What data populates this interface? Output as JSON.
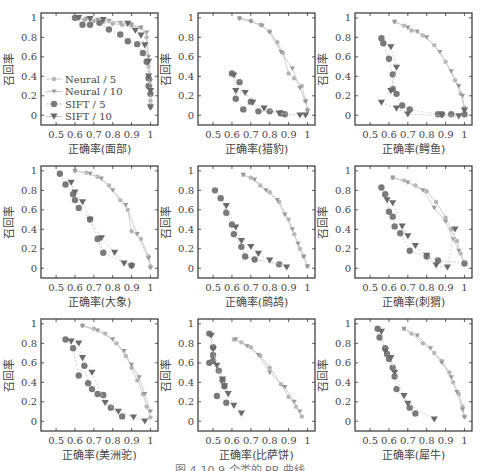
{
  "figure": {
    "caption": "图 4-10 9 个类的 PR 曲线",
    "ylabel": "召回率",
    "xticks": [
      "0.5",
      "0.6",
      "0.7",
      "0.8",
      "0.9",
      "1"
    ],
    "yticks": [
      "0",
      "0.2",
      "0.4",
      "0.6",
      "0.8",
      "1"
    ],
    "legend": [
      "Neural / 5",
      "Neural / 10",
      "SIFT / 5",
      "SIFT / 10"
    ],
    "colors": {
      "neural5": "#b4b4b4",
      "neural10": "#9a9a9a",
      "sift5": "#7a7a7a",
      "sift10": "#6a6a6a",
      "line": "#c8c8c8",
      "axis": "#333333"
    }
  },
  "chart_data": [
    {
      "type": "scatter",
      "title": "面部",
      "xlabel": "正确率(面部)",
      "ylabel": "召回率",
      "xlim": [
        0.42,
        1.04
      ],
      "ylim": [
        -0.1,
        1.05
      ],
      "legend_position": "lower left",
      "series": [
        {
          "name": "Neural/5",
          "x": [
            0.6,
            0.65,
            0.7,
            0.75,
            0.8,
            0.85,
            0.9,
            0.95,
            0.98,
            0.99,
            1.0,
            1.0,
            1.0
          ],
          "y": [
            1,
            0.98,
            0.97,
            0.96,
            0.94,
            0.93,
            0.92,
            0.9,
            0.8,
            0.5,
            0.3,
            0.15,
            0.08
          ]
        },
        {
          "name": "Neural/10",
          "x": [
            0.6,
            0.66,
            0.72,
            0.78,
            0.84,
            0.9,
            0.95,
            0.98,
            0.99,
            1.0,
            1.0
          ],
          "y": [
            1,
            0.99,
            0.98,
            0.97,
            0.95,
            0.93,
            0.9,
            0.85,
            0.6,
            0.35,
            0.1
          ]
        },
        {
          "name": "SIFT/5",
          "x": [
            0.6,
            0.64,
            0.68,
            0.73,
            0.78,
            0.84,
            0.88,
            0.93,
            0.96,
            0.98,
            0.99,
            0.99,
            1.0
          ],
          "y": [
            1,
            0.93,
            0.93,
            0.95,
            0.88,
            0.83,
            0.76,
            0.73,
            0.64,
            0.55,
            0.38,
            0.3,
            0.22
          ]
        },
        {
          "name": "SIFT/10",
          "x": [
            0.62,
            0.68,
            0.75,
            0.88,
            0.92,
            0.95,
            0.97,
            0.99,
            0.99,
            1.0,
            1.0
          ],
          "y": [
            1,
            0.99,
            0.98,
            0.94,
            0.87,
            0.82,
            0.72,
            0.55,
            0.4,
            0.25,
            0.08
          ]
        }
      ]
    },
    {
      "type": "scatter",
      "title": "猎豹",
      "xlabel": "正确率(猎豹)",
      "ylabel": "召回率",
      "xlim": [
        0.42,
        1.04
      ],
      "ylim": [
        -0.1,
        1.05
      ],
      "series": [
        {
          "name": "Neural/5",
          "x": [
            0.64,
            0.7,
            0.75,
            0.8,
            0.84,
            0.87,
            0.9,
            0.93,
            0.97,
            0.99,
            1.0
          ],
          "y": [
            1,
            0.97,
            0.93,
            0.86,
            0.75,
            0.64,
            0.43,
            0.38,
            0.3,
            0.15,
            0.06
          ]
        },
        {
          "name": "Neural/10",
          "x": [
            0.64,
            0.7,
            0.76,
            0.8,
            0.86,
            0.92,
            0.96,
            0.99,
            1.0
          ],
          "y": [
            0.99,
            0.96,
            0.92,
            0.85,
            0.65,
            0.48,
            0.28,
            0.14,
            0.04
          ]
        },
        {
          "name": "SIFT/5",
          "x": [
            0.6,
            0.64,
            0.62,
            0.66,
            0.7,
            0.74,
            0.8,
            0.86,
            0.88
          ],
          "y": [
            0.43,
            0.34,
            0.17,
            0.06,
            0.14,
            0.04,
            0.04,
            0.02,
            0.01
          ]
        },
        {
          "name": "SIFT/10",
          "x": [
            0.61,
            0.62,
            0.67,
            0.71,
            0.77,
            0.85,
            0.96,
            0.99
          ],
          "y": [
            0.41,
            0.25,
            0.23,
            0.13,
            0.07,
            0.02,
            0.0,
            0.0
          ]
        }
      ]
    },
    {
      "type": "scatter",
      "title": "鳄鱼",
      "xlabel": "正确率(鳄鱼)",
      "ylabel": "召回率",
      "xlim": [
        0.42,
        1.04
      ],
      "ylim": [
        -0.1,
        1.05
      ],
      "series": [
        {
          "name": "Neural/5",
          "x": [
            0.63,
            0.68,
            0.72,
            0.78,
            0.84,
            0.9,
            0.95,
            0.98,
            1.0,
            1.0
          ],
          "y": [
            0.96,
            0.92,
            0.87,
            0.82,
            0.72,
            0.55,
            0.36,
            0.22,
            0.08,
            0.01
          ]
        },
        {
          "name": "Neural/10",
          "x": [
            0.63,
            0.7,
            0.75,
            0.8,
            0.87,
            0.93,
            0.97,
            0.99,
            1.0
          ],
          "y": [
            0.96,
            0.9,
            0.86,
            0.8,
            0.65,
            0.45,
            0.3,
            0.2,
            0.05
          ]
        },
        {
          "name": "SIFT/5",
          "x": [
            0.56,
            0.57,
            0.6,
            0.62,
            0.62,
            0.64,
            0.67,
            0.71,
            0.86,
            0.88,
            0.93,
            1.0
          ],
          "y": [
            0.79,
            0.74,
            0.58,
            0.42,
            0.27,
            0.22,
            0.1,
            0.06,
            0.01,
            0.01,
            0.01,
            0.01
          ]
        },
        {
          "name": "SIFT/10",
          "x": [
            0.61,
            0.64,
            0.61,
            0.56,
            0.64,
            0.7,
            0.88,
            0.97,
            1.0
          ],
          "y": [
            0.7,
            0.49,
            0.25,
            0.13,
            0.07,
            0.01,
            0.0,
            -0.01,
            0.05
          ]
        }
      ]
    },
    {
      "type": "scatter",
      "title": "大象",
      "xlabel": "正确率(大象)",
      "ylabel": "召回率",
      "xlim": [
        0.42,
        1.04
      ],
      "ylim": [
        -0.1,
        1.05
      ],
      "series": [
        {
          "name": "Neural/5",
          "x": [
            0.6,
            0.66,
            0.72,
            0.78,
            0.84,
            0.88,
            0.9,
            0.95,
            0.99,
            1.0
          ],
          "y": [
            1,
            0.98,
            0.94,
            0.85,
            0.7,
            0.6,
            0.38,
            0.3,
            0.12,
            0.02
          ]
        },
        {
          "name": "Neural/10",
          "x": [
            0.6,
            0.68,
            0.74,
            0.8,
            0.87,
            0.93,
            0.99,
            1.0
          ],
          "y": [
            1,
            0.97,
            0.92,
            0.8,
            0.65,
            0.35,
            0.1,
            0.0
          ]
        },
        {
          "name": "SIFT/5",
          "x": [
            0.52,
            0.55,
            0.59,
            0.6,
            0.62,
            0.68,
            0.72,
            0.75,
            0.9
          ],
          "y": [
            0.97,
            0.86,
            0.76,
            0.7,
            0.62,
            0.5,
            0.3,
            0.16,
            0.03
          ]
        },
        {
          "name": "SIFT/10",
          "x": [
            0.58,
            0.6,
            0.64,
            0.68,
            0.74,
            0.81,
            0.86,
            0.9
          ],
          "y": [
            0.88,
            0.78,
            0.68,
            0.5,
            0.31,
            0.16,
            0.05,
            0.02
          ]
        }
      ]
    },
    {
      "type": "scatter",
      "title": "鹧鸪",
      "xlabel": "正确率(鹧鸪)",
      "ylabel": "召回率",
      "xlim": [
        0.42,
        1.04
      ],
      "ylim": [
        -0.1,
        1.05
      ],
      "series": [
        {
          "name": "Neural/5",
          "x": [
            0.66,
            0.7,
            0.75,
            0.8,
            0.85,
            0.9,
            0.93,
            0.96,
            0.98,
            1.0
          ],
          "y": [
            0.96,
            0.93,
            0.85,
            0.78,
            0.68,
            0.5,
            0.35,
            0.2,
            0.12,
            0.02
          ]
        },
        {
          "name": "Neural/10",
          "x": [
            0.66,
            0.72,
            0.78,
            0.84,
            0.88,
            0.92,
            0.95,
            0.98,
            1.0
          ],
          "y": [
            0.96,
            0.91,
            0.8,
            0.7,
            0.55,
            0.4,
            0.25,
            0.12,
            0.02
          ]
        },
        {
          "name": "SIFT/5",
          "x": [
            0.51,
            0.54,
            0.57,
            0.6,
            0.61,
            0.65,
            0.67,
            0.72,
            0.85
          ],
          "y": [
            0.8,
            0.72,
            0.57,
            0.45,
            0.35,
            0.22,
            0.12,
            0.09,
            0.04
          ]
        },
        {
          "name": "SIFT/10",
          "x": [
            0.57,
            0.62,
            0.65,
            0.7,
            0.74,
            0.8,
            0.89
          ],
          "y": [
            0.64,
            0.42,
            0.28,
            0.22,
            0.15,
            0.08,
            0.01
          ]
        }
      ]
    },
    {
      "type": "scatter",
      "title": "刺猬",
      "xlabel": "正确率(刺猬)",
      "ylabel": "召回率",
      "xlim": [
        0.42,
        1.04
      ],
      "ylim": [
        -0.1,
        1.05
      ],
      "series": [
        {
          "name": "Neural/5",
          "x": [
            0.62,
            0.68,
            0.74,
            0.8,
            0.85,
            0.9,
            0.93,
            0.96,
            0.98,
            1.0
          ],
          "y": [
            0.93,
            0.9,
            0.85,
            0.79,
            0.68,
            0.52,
            0.4,
            0.28,
            0.15,
            0.04
          ]
        },
        {
          "name": "Neural/10",
          "x": [
            0.62,
            0.7,
            0.78,
            0.84,
            0.9,
            0.94,
            0.97,
            1.0
          ],
          "y": [
            0.93,
            0.88,
            0.8,
            0.62,
            0.48,
            0.3,
            0.18,
            0.05
          ]
        },
        {
          "name": "SIFT/5",
          "x": [
            0.56,
            0.58,
            0.6,
            0.62,
            0.63,
            0.66,
            0.71,
            0.8,
            0.86,
            1.0
          ],
          "y": [
            0.83,
            0.76,
            0.58,
            0.53,
            0.43,
            0.36,
            0.18,
            0.12,
            0.08,
            0.05
          ]
        },
        {
          "name": "SIFT/10",
          "x": [
            0.59,
            0.62,
            0.67,
            0.7,
            0.74,
            0.8,
            0.85,
            0.91,
            0.95
          ],
          "y": [
            0.7,
            0.67,
            0.43,
            0.33,
            0.23,
            0.13,
            0.03,
            0.01,
            0.4
          ]
        }
      ]
    },
    {
      "type": "scatter",
      "title": "美洲驼",
      "xlabel": "正确率(美洲驼)",
      "ylabel": "召回率",
      "xlim": [
        0.42,
        1.04
      ],
      "ylim": [
        -0.1,
        1.05
      ],
      "series": [
        {
          "name": "Neural/5",
          "x": [
            0.64,
            0.7,
            0.76,
            0.82,
            0.87,
            0.9,
            0.93,
            0.96,
            0.98,
            1.0
          ],
          "y": [
            0.98,
            0.95,
            0.9,
            0.8,
            0.67,
            0.55,
            0.42,
            0.28,
            0.15,
            0.04
          ]
        },
        {
          "name": "Neural/10",
          "x": [
            0.64,
            0.72,
            0.8,
            0.86,
            0.9,
            0.94,
            0.97,
            1.0
          ],
          "y": [
            0.98,
            0.93,
            0.84,
            0.72,
            0.58,
            0.45,
            0.28,
            0.1
          ]
        },
        {
          "name": "SIFT/5",
          "x": [
            0.55,
            0.59,
            0.62,
            0.65,
            0.67,
            0.69,
            0.72,
            0.75,
            0.79,
            0.85
          ],
          "y": [
            0.84,
            0.75,
            0.47,
            0.57,
            0.39,
            0.33,
            0.28,
            0.27,
            0.14,
            0.05
          ]
        },
        {
          "name": "SIFT/10",
          "x": [
            0.58,
            0.62,
            0.64,
            0.69,
            0.76,
            0.83,
            0.91,
            0.97
          ],
          "y": [
            0.82,
            0.8,
            0.65,
            0.5,
            0.19,
            0.1,
            0.04,
            0.0
          ]
        }
      ]
    },
    {
      "type": "scatter",
      "title": "比萨饼",
      "xlabel": "正确率(比萨饼)",
      "ylabel": "召回率",
      "xlim": [
        0.42,
        1.04
      ],
      "ylim": [
        -0.1,
        1.05
      ],
      "series": [
        {
          "name": "Neural/5",
          "x": [
            0.61,
            0.65,
            0.7,
            0.75,
            0.8,
            0.86,
            0.9,
            0.94,
            0.97
          ],
          "y": [
            0.84,
            0.81,
            0.76,
            0.67,
            0.55,
            0.38,
            0.25,
            0.15,
            0.05
          ]
        },
        {
          "name": "Neural/10",
          "x": [
            0.62,
            0.68,
            0.74,
            0.8,
            0.88,
            0.93,
            0.96
          ],
          "y": [
            0.84,
            0.77,
            0.68,
            0.5,
            0.35,
            0.2,
            0.1
          ]
        },
        {
          "name": "SIFT/5",
          "x": [
            0.48,
            0.5,
            0.5,
            0.48,
            0.5,
            0.53,
            0.55,
            0.56,
            0.52,
            0.57
          ],
          "y": [
            0.9,
            0.76,
            0.68,
            0.6,
            0.62,
            0.52,
            0.42,
            0.36,
            0.26,
            0.19
          ]
        },
        {
          "name": "SIFT/10",
          "x": [
            0.49,
            0.5,
            0.52,
            0.55,
            0.56,
            0.58,
            0.61,
            0.65
          ],
          "y": [
            0.88,
            0.74,
            0.57,
            0.43,
            0.36,
            0.28,
            0.16,
            0.08
          ]
        }
      ]
    },
    {
      "type": "scatter",
      "title": "犀牛",
      "xlabel": "正确率(犀牛)",
      "ylabel": "召回率",
      "xlim": [
        0.42,
        1.04
      ],
      "ylim": [
        -0.1,
        1.05
      ],
      "series": [
        {
          "name": "Neural/5",
          "x": [
            0.68,
            0.72,
            0.78,
            0.84,
            0.88,
            0.92,
            0.94,
            0.97,
            0.99,
            1.0
          ],
          "y": [
            0.95,
            0.9,
            0.8,
            0.7,
            0.62,
            0.5,
            0.4,
            0.28,
            0.15,
            0.05
          ]
        },
        {
          "name": "Neural/10",
          "x": [
            0.68,
            0.75,
            0.82,
            0.88,
            0.93,
            0.96,
            0.99,
            1.0
          ],
          "y": [
            0.95,
            0.88,
            0.75,
            0.6,
            0.45,
            0.3,
            0.12,
            0.04
          ]
        },
        {
          "name": "SIFT/5",
          "x": [
            0.54,
            0.55,
            0.58,
            0.59,
            0.6,
            0.62,
            0.63,
            0.64,
            0.71,
            0.74
          ],
          "y": [
            0.95,
            0.86,
            0.75,
            0.69,
            0.64,
            0.55,
            0.46,
            0.33,
            0.14,
            0.08
          ]
        },
        {
          "name": "SIFT/10",
          "x": [
            0.56,
            0.58,
            0.61,
            0.63,
            0.68,
            0.7,
            0.84
          ],
          "y": [
            0.92,
            0.72,
            0.65,
            0.5,
            0.26,
            0.18,
            0.02
          ]
        }
      ]
    }
  ]
}
